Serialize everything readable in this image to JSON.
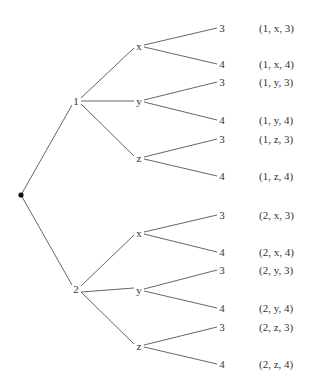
{
  "diagram": {
    "type": "tree",
    "root": {
      "x": 21,
      "y": 195
    },
    "level1": [
      {
        "label": "1",
        "x": 76,
        "y": 101
      },
      {
        "label": "2",
        "x": 76,
        "y": 289
      }
    ],
    "level2": [
      {
        "label": "x",
        "x": 139,
        "y": 46
      },
      {
        "label": "y",
        "x": 139,
        "y": 101
      },
      {
        "label": "z",
        "x": 139,
        "y": 158
      },
      {
        "label": "x",
        "x": 139,
        "y": 233
      },
      {
        "label": "y",
        "x": 139,
        "y": 290
      },
      {
        "label": "z",
        "x": 139,
        "y": 346
      }
    ],
    "leaves": [
      {
        "label": "3",
        "y": 28,
        "outcome": "(1, x, 3)"
      },
      {
        "label": "4",
        "y": 64,
        "outcome": "(1, x, 4)"
      },
      {
        "label": "3",
        "y": 82,
        "outcome": "(1, y, 3)"
      },
      {
        "label": "4",
        "y": 120,
        "outcome": "(1, y, 4)"
      },
      {
        "label": "3",
        "y": 139,
        "outcome": "(1, z, 3)"
      },
      {
        "label": "4",
        "y": 176,
        "outcome": "(1, z, 4)"
      },
      {
        "label": "3",
        "y": 215,
        "outcome": "(2, x, 3)"
      },
      {
        "label": "4",
        "y": 252,
        "outcome": "(2, x, 4)"
      },
      {
        "label": "3",
        "y": 270,
        "outcome": "(2, y, 3)"
      },
      {
        "label": "4",
        "y": 308,
        "outcome": "(2, y, 4)"
      },
      {
        "label": "3",
        "y": 327,
        "outcome": "(2, z, 3)"
      },
      {
        "label": "4",
        "y": 364,
        "outcome": "(2, z, 4)"
      }
    ],
    "leaf_x": 222,
    "outcome_x": 259
  }
}
